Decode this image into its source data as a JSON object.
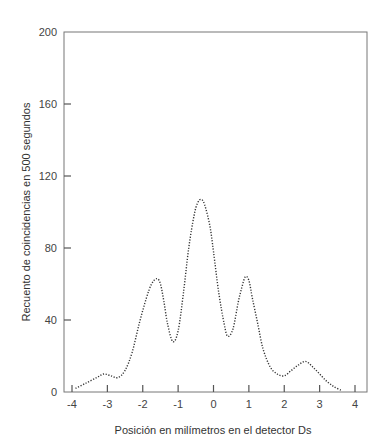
{
  "chart_data": {
    "type": "line",
    "title": "",
    "xlabel": "Posición en milímetros en el detector Ds",
    "ylabel": "Recuento de coincidencias en 500 segundos",
    "xlim": [
      -4,
      4
    ],
    "ylim": [
      0,
      200
    ],
    "xticks": [
      -4,
      -3,
      -2,
      -1,
      0,
      1,
      2,
      3,
      4
    ],
    "yticks": [
      0,
      40,
      80,
      120,
      160,
      200
    ],
    "grid": false,
    "legend": null,
    "line_style": "dotted",
    "series": [
      {
        "name": "coincidencias",
        "x": [
          -3.9,
          -3.6,
          -3.3,
          -3.1,
          -2.9,
          -2.7,
          -2.5,
          -2.3,
          -2.1,
          -1.9,
          -1.75,
          -1.6,
          -1.5,
          -1.4,
          -1.3,
          -1.15,
          -1.0,
          -0.85,
          -0.7,
          -0.55,
          -0.45,
          -0.35,
          -0.25,
          -0.1,
          0.0,
          0.15,
          0.3,
          0.4,
          0.55,
          0.7,
          0.8,
          0.9,
          1.0,
          1.1,
          1.25,
          1.4,
          1.6,
          1.8,
          2.0,
          2.2,
          2.4,
          2.6,
          2.8,
          3.0,
          3.2,
          3.4,
          3.6
        ],
        "y": [
          2,
          5,
          8,
          10,
          9,
          8,
          12,
          22,
          38,
          52,
          60,
          63,
          60,
          50,
          38,
          28,
          34,
          55,
          80,
          98,
          105,
          107,
          104,
          92,
          78,
          55,
          38,
          31,
          35,
          50,
          58,
          64,
          62,
          52,
          38,
          24,
          14,
          10,
          9,
          12,
          15,
          17,
          14,
          10,
          6,
          3,
          1
        ]
      }
    ]
  }
}
